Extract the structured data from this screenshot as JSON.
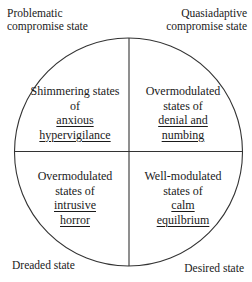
{
  "diagram": {
    "type": "quadrant-circle",
    "colors": {
      "stroke": "#333333",
      "text": "#1a1a1a",
      "background": "#ffffff"
    },
    "corners": {
      "top_left": [
        "Problematic",
        "compromise state"
      ],
      "top_right": [
        "Quasiadaptive",
        "compromise state"
      ],
      "bottom_left": "Dreaded state",
      "bottom_right": "Desired state"
    },
    "quadrants": {
      "top_left": {
        "lines": [
          "Shimmering states",
          "of"
        ],
        "underlined": [
          "anxious",
          "hypervigilance"
        ]
      },
      "top_right": {
        "lines": [
          "Overmodulated",
          "states of"
        ],
        "underlined": [
          "denial and",
          "numbing"
        ]
      },
      "bottom_left": {
        "lines": [
          "Overmodulated",
          "states of"
        ],
        "underlined": [
          "intrusive",
          "horror"
        ]
      },
      "bottom_right": {
        "lines": [
          "Well-modulated",
          "states of"
        ],
        "underlined": [
          "calm",
          "equilbrium"
        ]
      }
    }
  }
}
